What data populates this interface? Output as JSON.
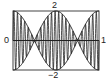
{
  "chart_data": {
    "type": "line",
    "title": "",
    "xlabel": "",
    "ylabel": "",
    "xlim": [
      0,
      1
    ],
    "ylim": [
      -2,
      2
    ],
    "tick_labels": {
      "x_left": "0",
      "x_right": "1",
      "y_top": "2",
      "y_bottom": "−2"
    },
    "grid": false,
    "legend": null,
    "series": [
      {
        "name": "envelope_upper",
        "expr": "2*cos(2*pi*x)"
      },
      {
        "name": "envelope_lower",
        "expr": "-2*cos(2*pi*x)"
      },
      {
        "name": "modulated_signal",
        "expr": "2*cos(2*pi*x)*sin(2*pi*24*x)"
      }
    ],
    "colors": {
      "line": "#222222",
      "frame": "#444444"
    }
  }
}
